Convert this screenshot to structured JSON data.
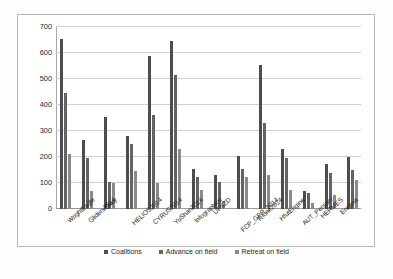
{
  "chart_data": {
    "type": "bar",
    "title": "",
    "subtitle": "",
    "xlabel": "",
    "ylabel": "",
    "ylim": [
      0,
      700
    ],
    "yticks": [
      0,
      100,
      200,
      300,
      400,
      500,
      600,
      700
    ],
    "grid": true,
    "legend_position": "bottom",
    "categories": [
      "WrightEagle",
      "Gliders2014",
      "Oxsy",
      "HELIOS2014",
      "CYRUS2014",
      "YuShan2014",
      "Infographics",
      "UFSZD",
      "FCP_GPR_2014",
      "RIone2014",
      "HfutEngine",
      "AUT_Persian",
      "HERMES",
      "Enigma"
    ],
    "series": [
      {
        "name": "Coalitions",
        "color": "#4d4d4d",
        "values": [
          655,
          265,
          355,
          280,
          590,
          645,
          155,
          130,
          205,
          555,
          230,
          70,
          175,
          200
        ]
      },
      {
        "name": "Advance on field",
        "color": "#636363",
        "values": [
          445,
          195,
          105,
          250,
          360,
          515,
          125,
          105,
          155,
          330,
          195,
          60,
          140,
          150
        ]
      },
      {
        "name": "Retreat on field",
        "color": "#8a8a8a",
        "values": [
          210,
          70,
          100,
          145,
          100,
          230,
          75,
          30,
          125,
          130,
          75,
          25,
          55,
          110
        ]
      }
    ]
  },
  "legend": {
    "items": [
      {
        "label": "Coalitions"
      },
      {
        "label": "Advance on field"
      },
      {
        "label": "Retreat on field"
      }
    ]
  }
}
